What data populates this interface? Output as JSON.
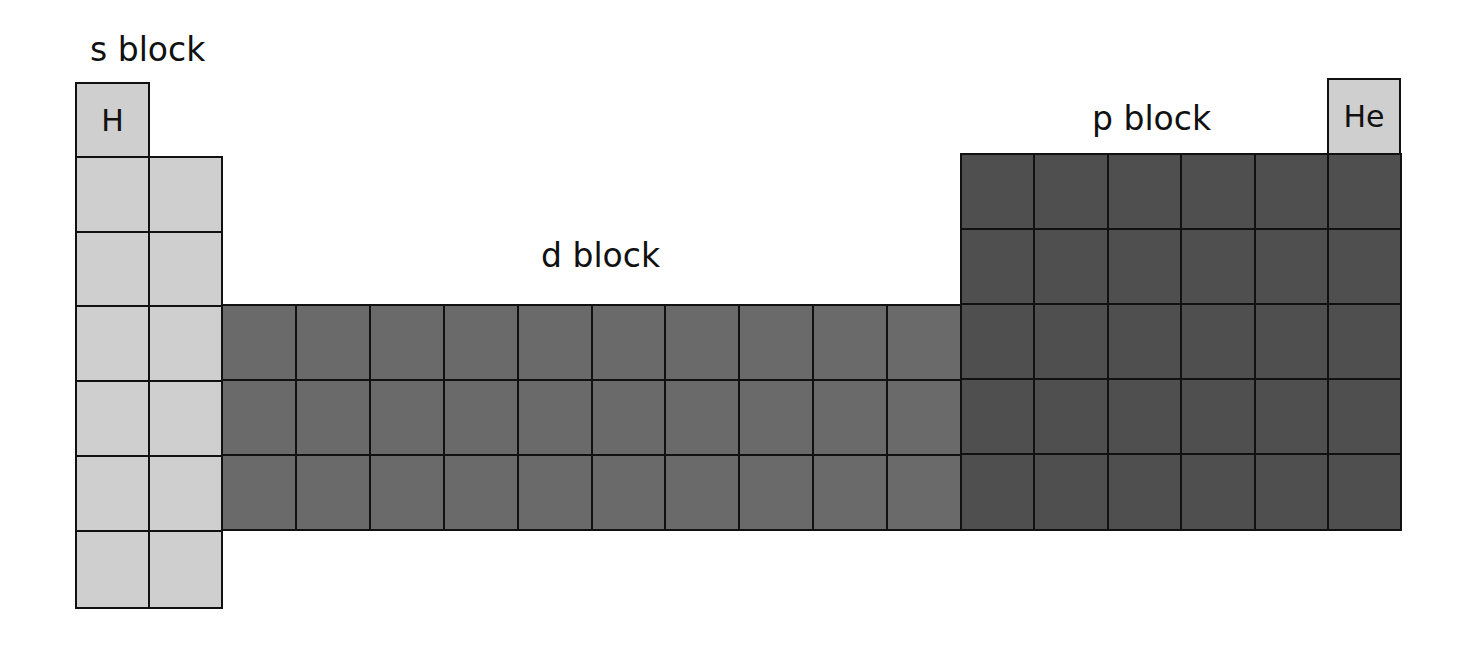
{
  "labels": {
    "s_block": "s block",
    "d_block": "d block",
    "p_block": "p block"
  },
  "elements": {
    "hydrogen": "H",
    "helium": "He"
  },
  "colors": {
    "s_block_fill": "#cfcfcf",
    "d_block_fill": "#6a6a6a",
    "p_block_fill": "#4f4f4f",
    "grid_line": "#111111"
  },
  "layout": {
    "s_block": {
      "columns": 2,
      "rows": 7,
      "note": "H alone in row 1 column 1"
    },
    "d_block": {
      "columns": 10,
      "rows": 3,
      "starts_at_row": 4
    },
    "p_block": {
      "columns": 6,
      "rows": 5,
      "starts_at_row": 2,
      "note": "He above last column"
    }
  }
}
